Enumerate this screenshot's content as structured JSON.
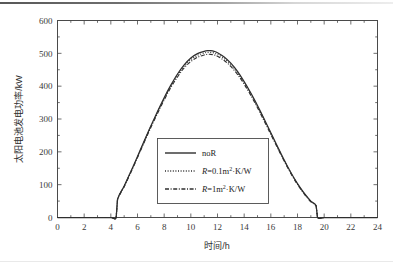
{
  "figure": {
    "background_color": "#ffffff",
    "line_color": "#2f2f2f",
    "axis_color": "#4a4a4a"
  },
  "chart_data": {
    "type": "line",
    "title": "",
    "xlabel": "时间/h",
    "ylabel": "太阳电池发电功率/kW",
    "xlim": [
      0,
      24
    ],
    "ylim": [
      0,
      600
    ],
    "xticks": [
      0,
      2,
      4,
      6,
      8,
      10,
      12,
      14,
      16,
      18,
      20,
      22,
      24
    ],
    "yticks": [
      0,
      100,
      200,
      300,
      400,
      500,
      600
    ],
    "xtick_labels": [
      "0",
      "2",
      "4",
      "6",
      "8",
      "10",
      "12",
      "14",
      "16",
      "18",
      "20",
      "22",
      "24"
    ],
    "ytick_labels": [
      "0",
      "100",
      "200",
      "300",
      "400",
      "500",
      "600"
    ],
    "grid": false,
    "minor_ticks": true,
    "legend_position": "center-right-lower",
    "x": [
      0,
      1,
      2,
      3,
      4,
      4.4,
      4.5,
      5,
      5.5,
      6,
      6.5,
      7,
      7.5,
      8,
      8.5,
      9,
      9.5,
      10,
      10.5,
      11,
      11.25,
      11.5,
      11.75,
      12,
      12.5,
      13,
      13.5,
      14,
      14.5,
      15,
      15.5,
      16,
      16.5,
      17,
      17.5,
      18,
      18.5,
      19,
      19.4,
      19.5,
      20,
      21,
      22,
      23,
      24
    ],
    "series": [
      {
        "name": "noR",
        "style": "solid",
        "values": [
          0,
          0,
          0,
          0,
          0,
          0,
          55,
          96,
          140,
          186,
          233,
          279,
          323,
          365,
          403,
          437,
          465,
          486,
          499,
          506,
          508,
          508,
          506,
          502,
          489,
          470,
          445,
          414,
          379,
          341,
          300,
          258,
          216,
          175,
          137,
          103,
          74,
          50,
          36,
          0,
          0,
          0,
          0,
          0,
          0
        ]
      },
      {
        "name": "R=0.1m²·K/W",
        "style": "dotted",
        "values": [
          0,
          0,
          0,
          0,
          0,
          0,
          54,
          95,
          139,
          185,
          231,
          277,
          321,
          362,
          400,
          433,
          461,
          481,
          494,
          501,
          503,
          503,
          501,
          497,
          484,
          466,
          441,
          411,
          376,
          338,
          298,
          256,
          214,
          174,
          136,
          102,
          73,
          49,
          35,
          0,
          0,
          0,
          0,
          0,
          0
        ]
      },
      {
        "name": "R=1m²·K/W",
        "style": "dashdot",
        "values": [
          0,
          0,
          0,
          0,
          0,
          0,
          53,
          94,
          137,
          183,
          229,
          274,
          317,
          358,
          396,
          428,
          456,
          475,
          488,
          495,
          497,
          497,
          495,
          491,
          478,
          460,
          436,
          406,
          372,
          334,
          294,
          253,
          212,
          172,
          134,
          101,
          72,
          48,
          34,
          0,
          0,
          0,
          0,
          0,
          0
        ]
      }
    ]
  },
  "legend": {
    "entries": [
      {
        "label": "noR",
        "label_prefix": "",
        "label_sub": "",
        "style": "solid"
      },
      {
        "label": "R=0.1m²·K/W",
        "sym": "R",
        "eq": "=0.1m",
        "sup": "2",
        "tail": "·K/W",
        "style": "dotted"
      },
      {
        "label": "R=1m²·K/W",
        "sym": "R",
        "eq": "=1m",
        "sup": "2",
        "tail": "·K/W",
        "style": "dashdot"
      }
    ]
  }
}
